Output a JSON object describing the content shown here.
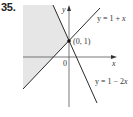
{
  "problem": {
    "number": "35."
  },
  "graph": {
    "axes": {
      "x_label": "x",
      "y_label": "y",
      "origin_label": "0"
    },
    "point": {
      "label": "(0, 1)"
    },
    "lines": [
      {
        "id": "line1",
        "equation": "y = 1 + x",
        "label_prefix": "y = 1 + ",
        "label_var": "x"
      },
      {
        "id": "line2",
        "equation": "y = 1 − 2x",
        "label_prefix": "y = 1 − 2",
        "label_var": "x"
      }
    ],
    "shaded_region": "y ≥ 1 + x and y ≤ 1 − 2x",
    "colors": {
      "shade": "#e6e6e6",
      "line": "#2a2a2a",
      "axis": "#555555"
    }
  }
}
